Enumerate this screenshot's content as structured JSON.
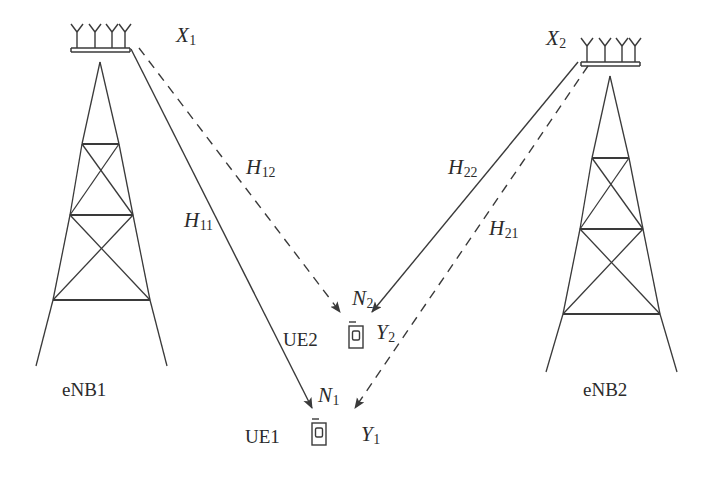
{
  "figure": {
    "background_color": "#ffffff",
    "stroke_color": "#3a3a3a",
    "text_color": "#2b2b2b"
  },
  "base_stations": [
    {
      "id": "enb1",
      "label": "eNB1",
      "label_x": 62,
      "label_y": 380,
      "tower_center_x": 100,
      "antenna_count": 4,
      "transmit_signal": "X",
      "transmit_signal_sub": "1"
    },
    {
      "id": "enb2",
      "label": "eNB2",
      "label_x": 583,
      "label_y": 380,
      "tower_center_x": 610,
      "antenna_count": 4,
      "transmit_signal": "X",
      "transmit_signal_sub": "2"
    }
  ],
  "user_equipments": [
    {
      "id": "ue2",
      "label": "UE2",
      "label_x": 283,
      "label_y": 330,
      "device_x": 355,
      "device_y": 327,
      "noise_label": "N",
      "noise_sub": "2",
      "noise_x": 352,
      "noise_y": 288,
      "received_label": "Y",
      "received_sub": "2",
      "received_x": 376,
      "received_y": 322
    },
    {
      "id": "ue1",
      "label": "UE1",
      "label_x": 245,
      "label_y": 427,
      "device_x": 318,
      "device_y": 424,
      "noise_label": "N",
      "noise_sub": "1",
      "noise_x": 318,
      "noise_y": 385,
      "received_label": "Y",
      "received_sub": "1",
      "received_x": 361,
      "received_y": 424
    }
  ],
  "transmit_labels": [
    {
      "name": "x1-label",
      "text": "X",
      "sub": "1",
      "x": 176,
      "y": 25
    },
    {
      "name": "x2-label",
      "text": "X",
      "sub": "2",
      "x": 546,
      "y": 28
    }
  ],
  "channels": [
    {
      "id": "h11",
      "label": "H",
      "sub": "11",
      "style": "solid",
      "from": "eNB1",
      "to": "UE1",
      "label_x": 184,
      "label_y": 210,
      "x1": 131,
      "y1": 49,
      "x2": 312,
      "y2": 408
    },
    {
      "id": "h12",
      "label": "H",
      "sub": "12",
      "style": "dashed",
      "from": "eNB1",
      "to": "UE2",
      "label_x": 246,
      "label_y": 157,
      "x1": 137,
      "y1": 48,
      "x2": 340,
      "y2": 312
    },
    {
      "id": "h22",
      "label": "H",
      "sub": "22",
      "style": "solid",
      "from": "eNB2",
      "to": "UE2",
      "label_x": 448,
      "label_y": 157,
      "x1": 578,
      "y1": 62,
      "x2": 372,
      "y2": 312
    },
    {
      "id": "h21",
      "label": "H",
      "sub": "21",
      "style": "dashed",
      "from": "eNB2",
      "to": "UE1",
      "label_x": 489,
      "label_y": 218,
      "x1": 586,
      "y1": 64,
      "x2": 355,
      "y2": 408
    }
  ],
  "icons": {
    "antenna": "antenna-array-icon",
    "tower": "lattice-tower-icon",
    "handset": "mobile-handset-icon",
    "arrow": "arrowhead-icon"
  }
}
